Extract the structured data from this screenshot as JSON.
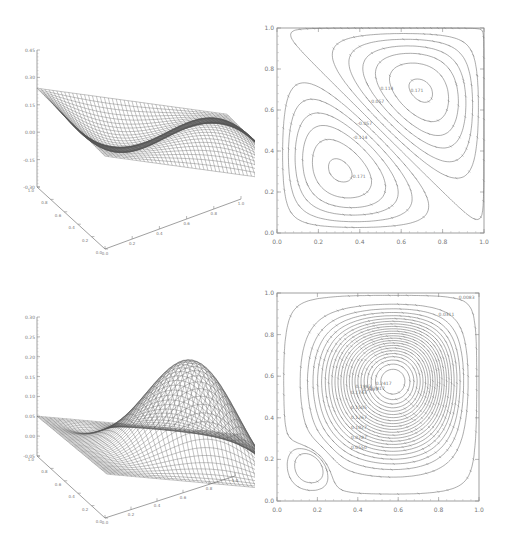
{
  "chart_data": [
    {
      "id": "surface-top",
      "type": "surface",
      "title": "",
      "description": "3D wireframe surface: antisymmetric two-cell field, peak near (0.7,0.7), trough near (0.25,0.25)",
      "x_ticks": [
        "0.0",
        "0.2",
        "0.4",
        "0.6",
        "0.8",
        "1.0"
      ],
      "y_ticks": [
        "0.0",
        "0.2",
        "0.4",
        "0.6",
        "0.8",
        "1.0"
      ],
      "z_ticks": [
        "-0.30",
        "-0.15",
        "0.00",
        "0.15",
        "0.30",
        "0.45"
      ],
      "zlim": [
        -0.3,
        0.45
      ],
      "peak": {
        "x": 0.7,
        "y": 0.7,
        "z": 0.34
      },
      "trough": {
        "x": 0.25,
        "y": 0.25,
        "z": -0.29
      }
    },
    {
      "id": "contour-top",
      "type": "contour",
      "xlim": [
        0.0,
        1.0
      ],
      "ylim": [
        0.0,
        1.0
      ],
      "x_ticks": [
        "0.0",
        "0.2",
        "0.4",
        "0.6",
        "0.8",
        "1.0"
      ],
      "y_ticks": [
        "0.0",
        "0.2",
        "0.4",
        "0.6",
        "0.8",
        "1.0"
      ],
      "levels": [
        -0.286,
        -0.228,
        -0.171,
        -0.114,
        -0.057,
        0.0,
        0.057,
        0.114,
        0.171,
        0.228,
        0.286,
        0.343
      ],
      "level_labels": [
        "0.057",
        "0.114",
        "0.171",
        "0.228",
        "0.286",
        "-0.057",
        "-0.114",
        "-0.171",
        "-0.287"
      ],
      "max_center": {
        "x": 0.7,
        "y": 0.7
      },
      "min_center": {
        "x": 0.25,
        "y": 0.27
      }
    },
    {
      "id": "surface-bottom",
      "type": "surface",
      "title": "",
      "description": "3D wireframe surface: single dominant peak near (0.65,0.65), small negative region near origin",
      "x_ticks": [
        "0.0",
        "0.2",
        "0.4",
        "0.6",
        "0.8",
        "1.0"
      ],
      "y_ticks": [
        "0.0",
        "0.2",
        "0.4",
        "0.6",
        "0.8",
        "1.0"
      ],
      "z_ticks": [
        "-0.05",
        "0.00",
        "0.05",
        "0.10",
        "0.15",
        "0.20",
        "0.25",
        "0.30"
      ],
      "zlim": [
        -0.05,
        0.3
      ],
      "peak": {
        "x": 0.65,
        "y": 0.65,
        "z": 0.25
      }
    },
    {
      "id": "contour-bottom",
      "type": "contour",
      "xlim": [
        0.0,
        1.0
      ],
      "ylim": [
        0.0,
        1.0
      ],
      "x_ticks": [
        "0.0",
        "0.2",
        "0.4",
        "0.6",
        "0.8",
        "1.0"
      ],
      "y_ticks": [
        "0.0",
        "0.2",
        "0.4",
        "0.6",
        "0.8",
        "1.0"
      ],
      "level_labels": [
        "0.0083",
        "0.0311",
        "0.0550",
        "0.0787",
        "0.1027",
        "0.1267",
        "0.1505",
        "0.1743",
        "0.1983",
        "0.2417"
      ],
      "max_center": {
        "x": 0.65,
        "y": 0.66
      },
      "min_center": {
        "x": 0.15,
        "y": 0.15
      }
    }
  ]
}
